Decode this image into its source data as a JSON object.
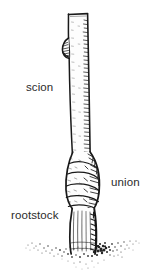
{
  "figure": {
    "background_color": "#ffffff",
    "ink_color": "#1a1a1a",
    "labels": {
      "scion": "scion",
      "union": "union",
      "rootstock": "rootstock"
    },
    "parts": [
      {
        "name": "scion",
        "description": "upper slender stem above graft"
      },
      {
        "name": "union",
        "description": "swollen gnarled graft junction"
      },
      {
        "name": "rootstock",
        "description": "thick lower stem entering soil"
      },
      {
        "name": "soil",
        "description": "stippled ground line at base"
      }
    ]
  }
}
